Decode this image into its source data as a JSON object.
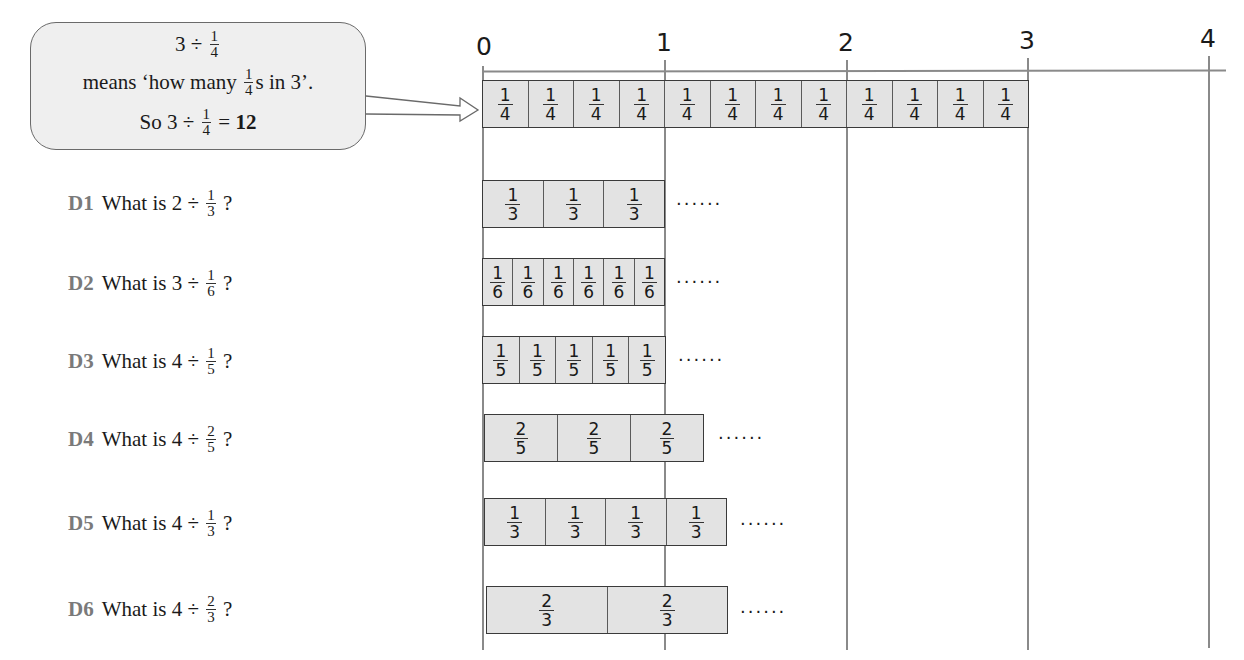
{
  "callout": {
    "line1_prefix": "3 ÷",
    "line1_frac": {
      "num": "1",
      "den": "4"
    },
    "line2_prefix": "means ‘how many",
    "line2_frac": {
      "num": "1",
      "den": "4"
    },
    "line2_suffix": "s in 3’.",
    "line3_prefix": "So 3 ÷",
    "line3_frac": {
      "num": "1",
      "den": "4"
    },
    "line3_eq": "=",
    "line3_answer": "12"
  },
  "number_line": {
    "ticks": [
      "0",
      "1",
      "2",
      "3",
      "4"
    ]
  },
  "example_bar": {
    "segments": 12,
    "label": {
      "num": "1",
      "den": "4"
    }
  },
  "questions": [
    {
      "id": "D1",
      "text": "What is 2 ÷",
      "frac": {
        "num": "1",
        "den": "3"
      },
      "q": "?",
      "bar_segments": 3,
      "bar_label": {
        "num": "1",
        "den": "3"
      },
      "dots": "......"
    },
    {
      "id": "D2",
      "text": "What is 3 ÷",
      "frac": {
        "num": "1",
        "den": "6"
      },
      "q": "?",
      "bar_segments": 6,
      "bar_label": {
        "num": "1",
        "den": "6"
      },
      "dots": "......"
    },
    {
      "id": "D3",
      "text": "What is 4 ÷",
      "frac": {
        "num": "1",
        "den": "5"
      },
      "q": "?",
      "bar_segments": 5,
      "bar_label": {
        "num": "1",
        "den": "5"
      },
      "dots": "......"
    },
    {
      "id": "D4",
      "text": "What is 4 ÷",
      "frac": {
        "num": "2",
        "den": "5"
      },
      "q": "?",
      "bar_segments": 3,
      "bar_label": {
        "num": "2",
        "den": "5"
      },
      "dots": "......"
    },
    {
      "id": "D5",
      "text": "What is 4 ÷",
      "frac": {
        "num": "1",
        "den": "3"
      },
      "q": "?",
      "bar_segments": 4,
      "bar_label": {
        "num": "1",
        "den": "3"
      },
      "dots": "......"
    },
    {
      "id": "D6",
      "text": "What is 4 ÷",
      "frac": {
        "num": "2",
        "den": "3"
      },
      "q": "?",
      "bar_segments": 2,
      "bar_label": {
        "num": "2",
        "den": "3"
      },
      "dots": "......"
    }
  ],
  "colors": {
    "bar_fill": "#e3e3e3",
    "callout_fill": "#efefef",
    "question_id": "#7a7a7a",
    "grid_line": "#8a8a8a"
  }
}
